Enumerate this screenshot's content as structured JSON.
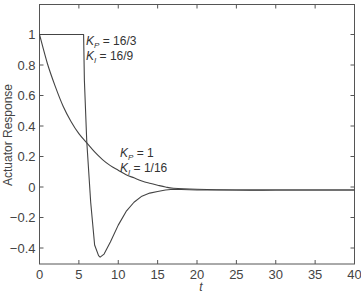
{
  "chart_data": {
    "type": "line",
    "title": "",
    "xlabel": "t",
    "ylabel": "Actuator Response",
    "xlim": [
      0,
      40
    ],
    "ylim": [
      -0.5,
      1.2
    ],
    "grid": false,
    "x_ticks": [
      0,
      5,
      10,
      15,
      20,
      25,
      30,
      35,
      40
    ],
    "x_tick_labels": [
      "0",
      "5",
      "10",
      "15",
      "20",
      "25",
      "30",
      "35",
      "40"
    ],
    "y_ticks": [
      -0.4,
      -0.2,
      0,
      0.2,
      0.4,
      0.6,
      0.8,
      1
    ],
    "y_tick_labels": [
      "−0.4",
      "−0.2",
      "0",
      "0.2",
      "0.4",
      "0.6",
      "0.8",
      "1"
    ],
    "series": [
      {
        "name": "K_P = 16/3, K_I = 16/9",
        "x": [
          0,
          5.6,
          5.7,
          6.0,
          6.5,
          7.0,
          7.5,
          7.7,
          8.2,
          9.0,
          10.0,
          11.0,
          12.0,
          13.0,
          14.0,
          15.0,
          16.0,
          17.0,
          20.0,
          25.0,
          30.0,
          35.0,
          40.0
        ],
        "values": [
          1,
          1,
          0.7,
          0.3,
          -0.1,
          -0.38,
          -0.45,
          -0.46,
          -0.44,
          -0.36,
          -0.25,
          -0.16,
          -0.1,
          -0.06,
          -0.04,
          -0.03,
          -0.02,
          -0.015,
          -0.02,
          -0.02,
          -0.02,
          -0.02,
          -0.02
        ]
      },
      {
        "name": "K_P = 1, K_I = 1/16",
        "x": [
          0,
          1,
          2,
          3,
          4,
          5,
          6,
          7,
          8,
          9,
          10,
          11,
          12,
          13,
          14,
          15,
          16,
          17,
          20,
          25,
          30,
          35,
          40
        ],
        "values": [
          1,
          0.81,
          0.66,
          0.53,
          0.43,
          0.35,
          0.29,
          0.23,
          0.18,
          0.14,
          0.11,
          0.08,
          0.06,
          0.04,
          0.025,
          0.012,
          0.0,
          -0.008,
          -0.015,
          -0.02,
          -0.02,
          -0.02,
          -0.02
        ]
      }
    ],
    "annotations": [
      {
        "text_main": "K",
        "sub": "P",
        "rest": " = 16/3",
        "t": 6.0,
        "y": 0.99
      },
      {
        "text_main": "K",
        "sub": "I",
        "rest": " = 16/9",
        "t": 6.0,
        "y": 0.89
      },
      {
        "text_main": "K",
        "sub": "P",
        "rest": " = 1",
        "t": 10.3,
        "y": 0.22
      },
      {
        "text_main": "K",
        "sub": "I",
        "rest": " = 1/16",
        "t": 10.3,
        "y": 0.12
      }
    ]
  },
  "labels": {
    "ylabel": "Actuator Response",
    "xlabel": "t",
    "ann1_p": " = 16/3",
    "ann1_i": " = 16/9",
    "ann2_p": " = 1",
    "ann2_i": " = 1/16",
    "k": "K",
    "sub_p": "P",
    "sub_i": "I"
  }
}
